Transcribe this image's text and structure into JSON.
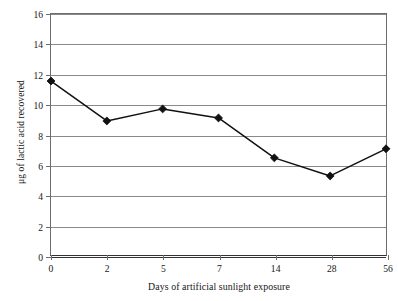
{
  "chart_data": {
    "type": "line",
    "title": "",
    "xlabel": "Days of artificial sunlight exposure",
    "ylabel": "μg of lactic acid recovered",
    "categories": [
      "0",
      "2",
      "5",
      "7",
      "14",
      "28",
      "56"
    ],
    "values": [
      11.55,
      8.9,
      9.7,
      9.1,
      6.45,
      5.25,
      7.05
    ],
    "series": [
      {
        "name": "lactic acid recovered",
        "values": [
          11.55,
          8.9,
          9.7,
          9.1,
          6.45,
          5.25,
          7.05
        ]
      }
    ],
    "ylim": [
      0,
      16
    ],
    "y_ticks": [
      "0",
      "2",
      "4",
      "6",
      "8",
      "10",
      "12",
      "14",
      "16"
    ],
    "x_ticks": [
      "0",
      "2",
      "5",
      "7",
      "14",
      "28",
      "56"
    ],
    "grid": "horizontal",
    "legend": "none",
    "marker": "diamond",
    "line_color": "#111111",
    "marker_color": "#111111",
    "grid_color": "#8a8a8a",
    "axis_color": "#333333",
    "background": "#ffffff"
  }
}
